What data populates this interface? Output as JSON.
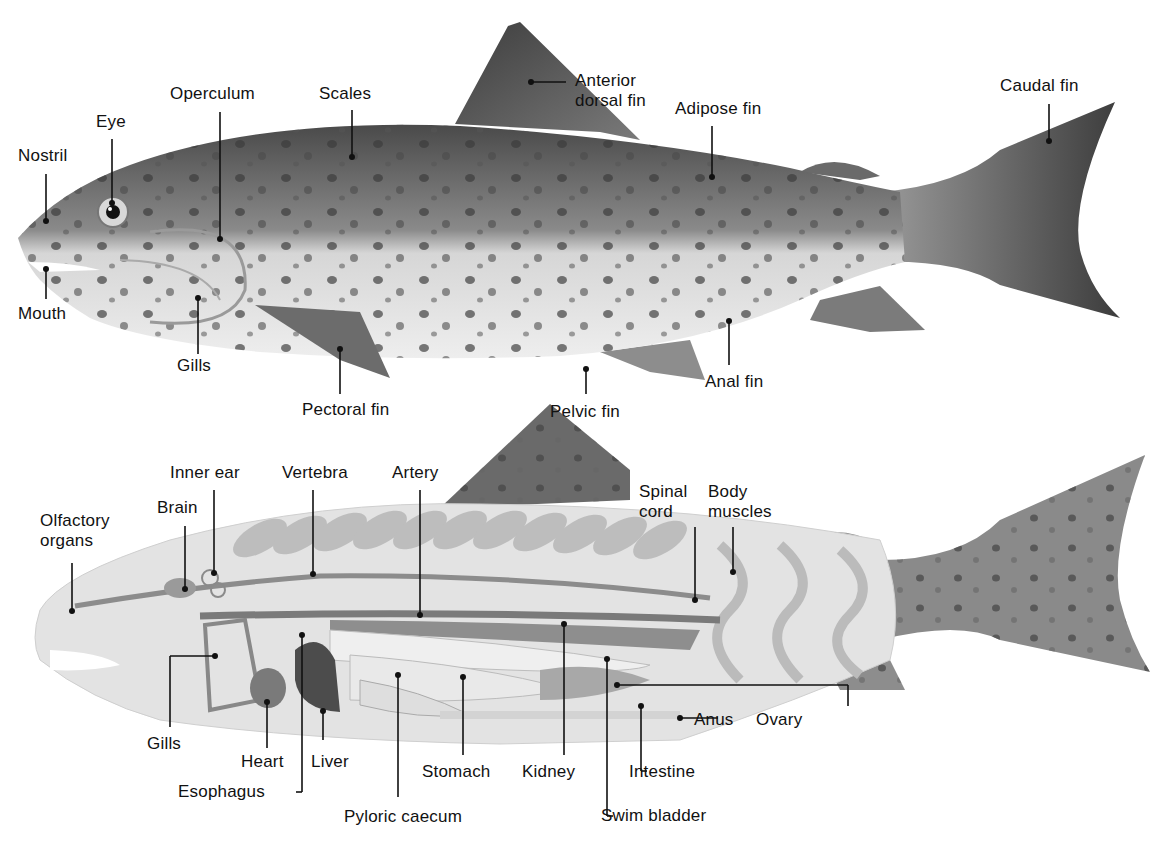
{
  "external": {
    "labels": {
      "nostril": "Nostril",
      "eye": "Eye",
      "operculum": "Operculum",
      "scales": "Scales",
      "anterior_dorsal_fin_1": "Anterior",
      "anterior_dorsal_fin_2": "dorsal fin",
      "adipose_fin": "Adipose fin",
      "caudal_fin": "Caudal fin",
      "mouth": "Mouth",
      "gills": "Gills",
      "pectoral_fin": "Pectoral fin",
      "pelvic_fin": "Pelvic fin",
      "anal_fin": "Anal fin"
    }
  },
  "internal": {
    "labels": {
      "olfactory_organs_1": "Olfactory",
      "olfactory_organs_2": "organs",
      "brain": "Brain",
      "inner_ear": "Inner ear",
      "vertebra": "Vertebra",
      "artery": "Artery",
      "spinal_cord_1": "Spinal",
      "spinal_cord_2": "cord",
      "body_muscles_1": "Body",
      "body_muscles_2": "muscles",
      "gills": "Gills",
      "heart": "Heart",
      "liver": "Liver",
      "esophagus": "Esophagus",
      "stomach": "Stomach",
      "pyloric_caecum": "Pyloric caecum",
      "kidney": "Kidney",
      "swim_bladder": "Swim bladder",
      "intestine": "Intestine",
      "anus": "Anus",
      "ovary": "Ovary"
    }
  },
  "colors": {
    "background": "#ffffff",
    "body_dark": "#5e5e5e",
    "body_light": "#e6e6e6",
    "label_text": "#111111"
  }
}
